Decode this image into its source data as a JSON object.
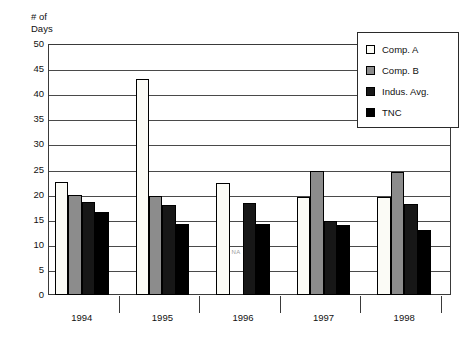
{
  "partial_title": "",
  "axis_title": "# of\nDays",
  "na_marker": "NA",
  "legend": {
    "items": [
      {
        "label": "Comp. A",
        "color": "#fbfbf6",
        "swatch": "legend-swatch-comp-a"
      },
      {
        "label": "Comp. B",
        "color": "#8c8c8c",
        "swatch": "legend-swatch-comp-b"
      },
      {
        "label": "Indus. Avg.",
        "color": "#171717",
        "swatch": "legend-swatch-indus-avg"
      },
      {
        "label": "TNC",
        "color": "#000000",
        "swatch": "legend-swatch-tnc"
      }
    ]
  },
  "chart_data": {
    "type": "bar",
    "title": "",
    "xlabel": "",
    "ylabel": "# of Days",
    "ylim": [
      0,
      50
    ],
    "ytick_step": 5,
    "yticks": [
      50,
      45,
      40,
      35,
      30,
      25,
      20,
      15,
      10,
      5,
      0
    ],
    "grid": true,
    "legend_position": "top-right",
    "categories": [
      "1994",
      "1995",
      "1996",
      "1997",
      "1998"
    ],
    "series": [
      {
        "name": "Comp. A",
        "color": "#fbfbf6",
        "values": [
          22.5,
          43.0,
          22.3,
          19.6,
          19.6
        ]
      },
      {
        "name": "Comp. B",
        "color": "#8c8c8c",
        "values": [
          19.9,
          19.8,
          null,
          24.7,
          24.6
        ]
      },
      {
        "name": "Indus. Avg.",
        "color": "#171717",
        "values": [
          18.6,
          18.0,
          18.4,
          14.8,
          18.1
        ]
      },
      {
        "name": "TNC",
        "color": "#000000",
        "values": [
          16.5,
          14.2,
          14.1,
          14.0,
          13.0
        ]
      }
    ],
    "annotations": [
      {
        "text": "NA",
        "category": "1996",
        "series": "Comp. B",
        "note": "data not available"
      }
    ]
  }
}
